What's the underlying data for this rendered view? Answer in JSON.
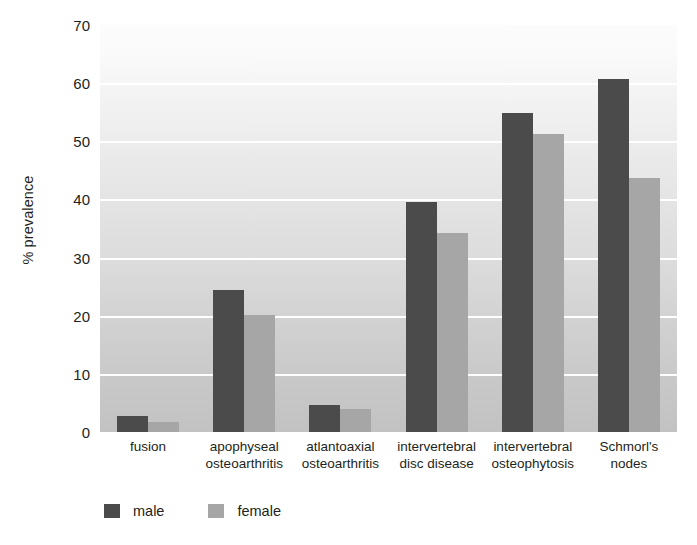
{
  "chart_data": {
    "type": "bar",
    "title": "",
    "xlabel": "",
    "ylabel": "% prevalence",
    "ylim": [
      0,
      70
    ],
    "ytick_step": 10,
    "yticks": [
      0,
      10,
      20,
      30,
      40,
      50,
      60,
      70
    ],
    "grid": true,
    "legend_position": "bottom-left",
    "categories": [
      "fusion",
      "apophyseal osteoarthritis",
      "atlantoaxial osteoarthritis",
      "intervertebral disc disease",
      "intervertebral osteophytosis",
      "Schmorl's nodes"
    ],
    "category_lines": [
      [
        "fusion"
      ],
      [
        "apophyseal",
        "osteoarthritis"
      ],
      [
        "atlantoaxial",
        "osteoarthritis"
      ],
      [
        "intervertebral",
        "disc disease"
      ],
      [
        "intervertebral",
        "osteophytosis"
      ],
      [
        "Schmorl's",
        "nodes"
      ]
    ],
    "series": [
      {
        "name": "male",
        "color": "#4b4b4b",
        "values": [
          2.8,
          24.5,
          4.7,
          39.5,
          54.8,
          60.8
        ]
      },
      {
        "name": "female",
        "color": "#a6a6a6",
        "values": [
          1.8,
          20.2,
          4.0,
          34.2,
          51.2,
          43.7
        ]
      }
    ]
  },
  "legend": {
    "items": [
      {
        "label": "male",
        "color": "#4b4b4b"
      },
      {
        "label": "female",
        "color": "#a6a6a6"
      }
    ]
  },
  "axes": {
    "y_title": "% prevalence"
  }
}
